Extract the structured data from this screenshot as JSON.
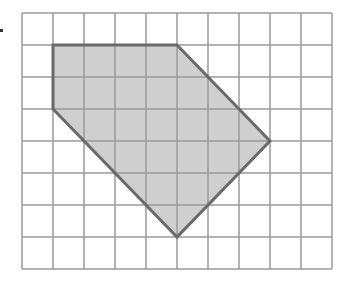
{
  "diagram": {
    "type": "grid-polygon",
    "grid": {
      "columns": 10,
      "rows": 8,
      "origin_px": [
        22,
        13
      ],
      "cell_w": 31,
      "cell_h": 32,
      "line_color": "#9a9a9a"
    },
    "polygon": {
      "vertices_grid": [
        [
          1,
          1
        ],
        [
          5,
          1
        ],
        [
          8,
          4
        ],
        [
          5,
          7
        ],
        [
          1,
          3
        ]
      ],
      "fill": "#cfcfcf",
      "stroke": "#6a6a6a",
      "stroke_width": 3
    },
    "bullet": true
  }
}
